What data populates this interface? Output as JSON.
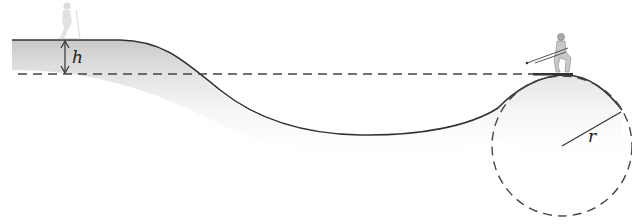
{
  "diagram": {
    "labels": {
      "height": "h",
      "radius": "r"
    },
    "colors": {
      "line": "#333333",
      "dash": "#444444",
      "shade": "#cfcfcf"
    },
    "figures": [
      "skier-start",
      "skier-top-of-hump"
    ]
  }
}
